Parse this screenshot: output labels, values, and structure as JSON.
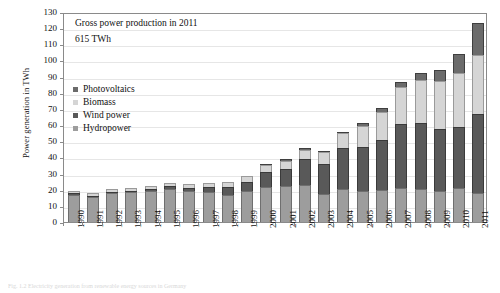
{
  "chart_data": {
    "type": "bar",
    "stacked": true,
    "title": "",
    "xlabel": "",
    "ylabel": "Power generation in TWh",
    "ylim": [
      0,
      130
    ],
    "ytick_step": 10,
    "yticks": [
      130,
      120,
      110,
      100,
      90,
      80,
      70,
      60,
      50,
      40,
      30,
      20,
      10,
      0
    ],
    "grid": true,
    "legend_position": "upper-left-inside",
    "categories": [
      "1990",
      "1991",
      "1992",
      "1993",
      "1994",
      "1995",
      "1996",
      "1997",
      "1998",
      "1999",
      "2000",
      "2001",
      "2002",
      "2003",
      "2004",
      "2005",
      "2006",
      "2007",
      "2008",
      "2009",
      "2010",
      "2011"
    ],
    "series": [
      {
        "name": "Hydropower",
        "color": "#9d9d9d",
        "values": [
          17.0,
          15.5,
          18.0,
          18.5,
          19.5,
          20.5,
          19.0,
          18.5,
          17.0,
          19.5,
          21.5,
          22.5,
          23.0,
          17.5,
          20.5,
          19.5,
          20.0,
          21.0,
          20.5,
          19.0,
          21.0,
          18.0
        ]
      },
      {
        "name": "Wind power",
        "color": "#595959",
        "values": [
          0.1,
          0.2,
          0.3,
          0.6,
          0.9,
          1.5,
          2.1,
          3.0,
          4.5,
          5.5,
          9.5,
          10.5,
          15.8,
          18.7,
          25.5,
          27.2,
          30.7,
          39.7,
          40.6,
          38.6,
          37.8,
          48.9
        ]
      },
      {
        "name": "Biomass",
        "color": "#d5d5d5",
        "values": [
          1.4,
          1.5,
          1.6,
          1.8,
          2.0,
          2.2,
          2.4,
          2.7,
          3.0,
          3.3,
          4.1,
          5.0,
          6.0,
          7.0,
          9.0,
          13.0,
          17.5,
          23.0,
          27.0,
          30.0,
          33.5,
          36.5
        ]
      },
      {
        "name": "Photovoltaics",
        "color": "#6b6b6b",
        "values": [
          0.0,
          0.0,
          0.0,
          0.0,
          0.0,
          0.0,
          0.0,
          0.0,
          0.0,
          0.0,
          0.1,
          0.1,
          0.2,
          0.3,
          0.6,
          1.3,
          2.2,
          3.1,
          4.4,
          6.6,
          11.7,
          19.6
        ]
      }
    ],
    "totals": [
      18.5,
      17.2,
      19.9,
      20.9,
      22.4,
      24.2,
      23.5,
      24.2,
      24.5,
      28.3,
      35.2,
      38.1,
      45.0,
      43.5,
      55.6,
      61.0,
      70.4,
      86.8,
      92.5,
      94.2,
      104.0,
      123.0
    ],
    "annotation_lines": [
      "Gross power production in 2011",
      "615 TWh"
    ]
  },
  "legend": {
    "items": [
      {
        "label": "Photovoltaics",
        "swatch": "sw-pv"
      },
      {
        "label": "Biomass",
        "swatch": "sw-bio"
      },
      {
        "label": "Wind power",
        "swatch": "sw-wind"
      },
      {
        "label": "Hydropower",
        "swatch": "sw-hydro"
      }
    ]
  },
  "caption": "Fig. 1.2 Electricity generation from renewable energy sources in Germany"
}
